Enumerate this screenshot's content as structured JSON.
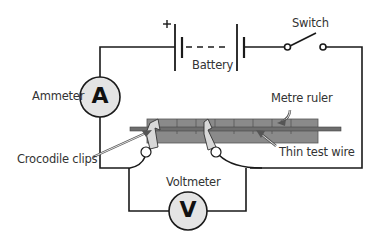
{
  "diagram": {
    "type": "circuit",
    "title": "",
    "components": {
      "battery": {
        "label": "Battery",
        "polarity_symbol": "+"
      },
      "switch": {
        "label": "Switch",
        "state": "open"
      },
      "ammeter": {
        "label": "Ammeter",
        "symbol": "A"
      },
      "voltmeter": {
        "label": "Voltmeter",
        "symbol": "V"
      },
      "metre_ruler": {
        "label": "Metre ruler"
      },
      "test_wire": {
        "label": "Thin test wire"
      },
      "clips": {
        "label": "Crocodile clips"
      }
    },
    "colors": {
      "wire": "#1a1a1a",
      "meter_fill": "#e4e4e4",
      "ruler_fill": "#8a8a8a",
      "rod_fill": "#6e6e6e",
      "clip_fill": "#d8d8d8",
      "text": "#333333"
    }
  }
}
